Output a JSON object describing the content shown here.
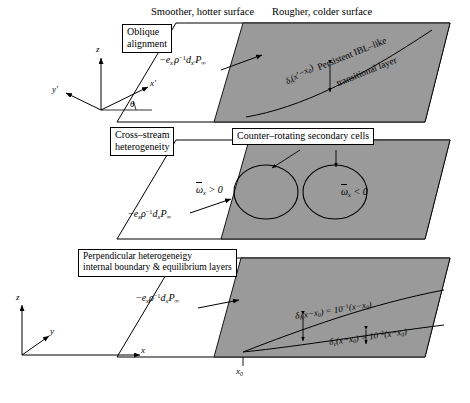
{
  "figure": {
    "title_left": "Smoother, hotter surface",
    "title_right": "Rougher, colder surface",
    "bg_color": "#ffffff",
    "rough_fill": "#9a9a9a",
    "line_color": "#000000"
  },
  "panels": [
    {
      "id": "panel-oblique",
      "label_box": "Oblique\nalignment",
      "label_line1": "Oblique",
      "label_line2": "alignment",
      "forcing": "−eₓ′ρ⁻¹ dₓ′P∞",
      "annotation_delta": "δᵢ(x′−x₀)",
      "annotation_line1": "Persistent IBL–like",
      "annotation_line2": "transitional layer",
      "axes": [
        "z",
        "y′",
        "x′"
      ],
      "angle_symbol": "θ"
    },
    {
      "id": "panel-cross-stream",
      "label_line1": "Cross–stream",
      "label_line2": "heterogeneity",
      "forcing": "−eₓρ⁻¹ dₓP∞",
      "cells_label": "Counter–rotating secondary cells",
      "vorticity_left": "ω̅ₓ > 0",
      "vorticity_right": "ω̅ₓ < 0"
    },
    {
      "id": "panel-perpendicular",
      "label_line1": "Perpendicular heterogeneigy",
      "label_line2": "internal boundary & equilibrium layers",
      "forcing": "−eₓρ⁻¹ dₓP∞",
      "delta_i": "δᵢ(x−x₀) = 10⁻¹(x−x₀)",
      "delta_e": "δₑ(x−x₀) = 10⁻²(x−x₀)",
      "axes": [
        "z",
        "y",
        "x"
      ],
      "origin_tick": "x₀"
    }
  ],
  "math": {
    "forcing_prime": {
      "e": "e",
      "sub1": "x′",
      "rho": "ρ",
      "exp": "−1",
      "d": "d",
      "sub2": "x′",
      "P": "P",
      "sub3": "∞",
      "minus": "−"
    },
    "forcing_plain": {
      "e": "e",
      "sub1": "x",
      "rho": "ρ",
      "exp": "−1",
      "d": "d",
      "sub2": "x",
      "P": "P",
      "sub3": "∞",
      "minus": "−"
    },
    "delta_i_label": {
      "sym": "δ",
      "sub": "i",
      "arg": "(x−x₀)",
      "eq": "= 10",
      "pow": "−1",
      "tail": "(x−x₀)"
    },
    "delta_e_label": {
      "sym": "δ",
      "sub": "e",
      "arg": "(x−x₀)",
      "eq": "= 10",
      "pow": "−2",
      "tail": "(x−x₀)"
    },
    "delta_prime_label": {
      "sym": "δ",
      "sub": "i",
      "arg": "(x′−x₀)"
    },
    "omega_left": {
      "sym": "ω",
      "sub": "x",
      "rel": "> 0"
    },
    "omega_right": {
      "sym": "ω",
      "sub": "x",
      "rel": "< 0"
    }
  }
}
